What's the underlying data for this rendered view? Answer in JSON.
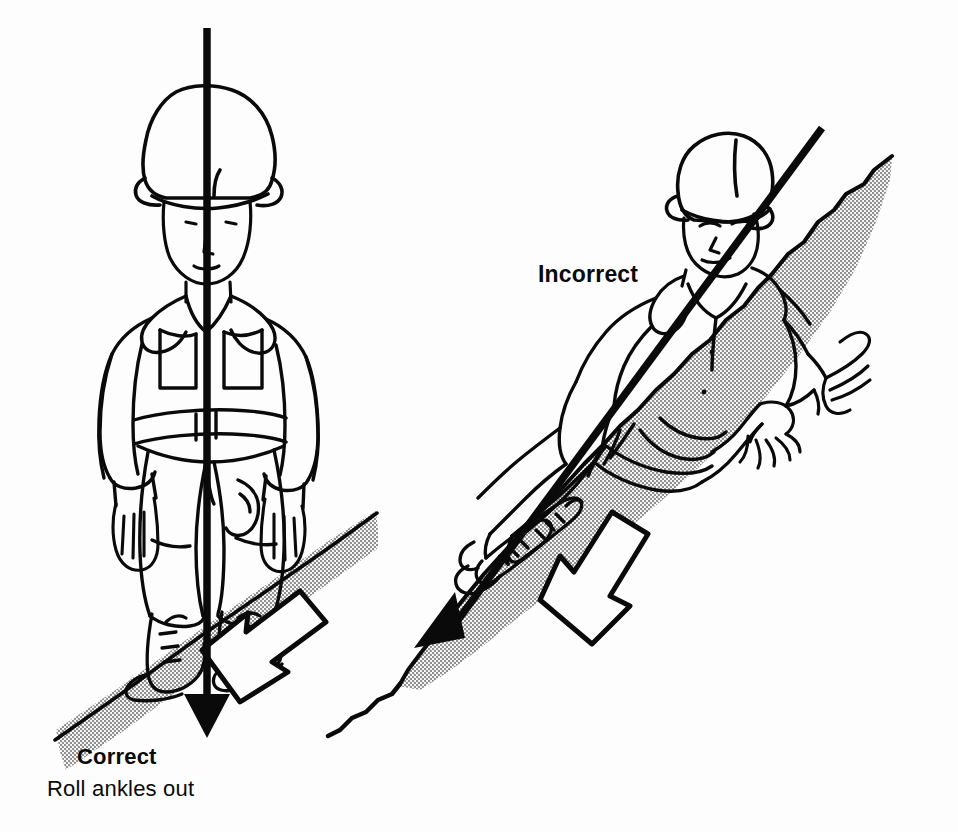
{
  "illustration": {
    "title": "Correct and incorrect body position when descending a slope",
    "background_color": "#fdfdfd",
    "ink_color": "#0a0a0a",
    "shade_color": "#a8a8a8"
  },
  "labels": {
    "correct": "Correct",
    "correct_caption": "Roll ankles out",
    "incorrect": "Incorrect"
  },
  "panels": [
    {
      "id": "correct-panel",
      "label": "Correct",
      "caption": "Roll ankles out",
      "figure": "soldier-standing-upright",
      "gravity_line": "vertical-arrow-down",
      "foot_arrow": "outlined-arrow-downslope",
      "terrain": "shaded-slope-band"
    },
    {
      "id": "incorrect-panel",
      "label": "Incorrect",
      "caption": "",
      "figure": "soldier-leaning-into-slope",
      "gravity_line": "diagonal-arrow-downslope",
      "foot_arrow": "outlined-arrow-downslope",
      "terrain": "shaded-hillside"
    }
  ]
}
